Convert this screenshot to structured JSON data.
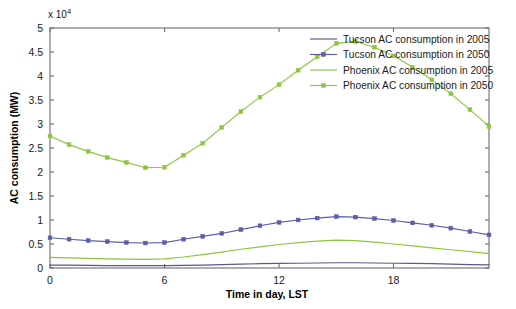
{
  "chart_data": {
    "type": "line",
    "title": "",
    "xlabel": "Time in day, LST",
    "ylabel": "AC consumption (MW)",
    "y_exponent_label": "x 10",
    "y_exponent_power": "4",
    "xlim": [
      0,
      23
    ],
    "ylim": [
      0,
      5
    ],
    "xticks": [
      0,
      6,
      12,
      18
    ],
    "xtick_labels": [
      "0",
      "6",
      "12",
      "18"
    ],
    "yticks": [
      0,
      0.5,
      1,
      1.5,
      2,
      2.5,
      3,
      3.5,
      4,
      4.5,
      5
    ],
    "ytick_labels": [
      "0",
      "0.5",
      "1",
      "1.5",
      "2",
      "2.5",
      "3",
      "3.5",
      "4",
      "4.5",
      "5"
    ],
    "grid": false,
    "legend_position": "upper right",
    "x": [
      0,
      1,
      2,
      3,
      4,
      5,
      6,
      7,
      8,
      9,
      10,
      11,
      12,
      13,
      14,
      15,
      16,
      17,
      18,
      19,
      20,
      21,
      22,
      23
    ],
    "series": [
      {
        "name": "Tucson AC consumption in 2005",
        "color": "#5a5a8c",
        "marker": "none",
        "values": [
          0.06,
          0.06,
          0.055,
          0.05,
          0.05,
          0.05,
          0.05,
          0.055,
          0.06,
          0.07,
          0.08,
          0.09,
          0.095,
          0.1,
          0.105,
          0.11,
          0.11,
          0.105,
          0.1,
          0.095,
          0.09,
          0.08,
          0.07,
          0.065
        ]
      },
      {
        "name": "Tucson AC consumption in 2050",
        "color": "#5b5ea6",
        "marker": "square",
        "values": [
          0.63,
          0.6,
          0.57,
          0.55,
          0.53,
          0.52,
          0.53,
          0.6,
          0.66,
          0.72,
          0.8,
          0.88,
          0.95,
          1.0,
          1.04,
          1.07,
          1.06,
          1.03,
          0.99,
          0.94,
          0.89,
          0.83,
          0.76,
          0.69
        ]
      },
      {
        "name": "Phoenix AC consumption in 2005",
        "color": "#8dc63f",
        "marker": "none",
        "values": [
          0.22,
          0.21,
          0.2,
          0.19,
          0.185,
          0.18,
          0.19,
          0.23,
          0.28,
          0.33,
          0.39,
          0.44,
          0.49,
          0.53,
          0.56,
          0.58,
          0.57,
          0.54,
          0.5,
          0.46,
          0.42,
          0.38,
          0.34,
          0.3
        ]
      },
      {
        "name": "Phoenix AC consumption in 2050",
        "color": "#8dc63f",
        "marker": "square",
        "values": [
          2.75,
          2.57,
          2.43,
          2.3,
          2.2,
          2.09,
          2.1,
          2.35,
          2.6,
          2.93,
          3.26,
          3.56,
          3.82,
          4.12,
          4.4,
          4.68,
          4.72,
          4.6,
          4.42,
          4.18,
          3.92,
          3.63,
          3.3,
          2.95
        ]
      }
    ]
  },
  "legend": {
    "entries": [
      {
        "label": "Tucson AC consumption in 2005"
      },
      {
        "label": "Tucson AC consumption in 2050"
      },
      {
        "label": "Phoenix AC consumption in 2005"
      },
      {
        "label": "Phoenix AC consumption in 2050"
      }
    ]
  }
}
